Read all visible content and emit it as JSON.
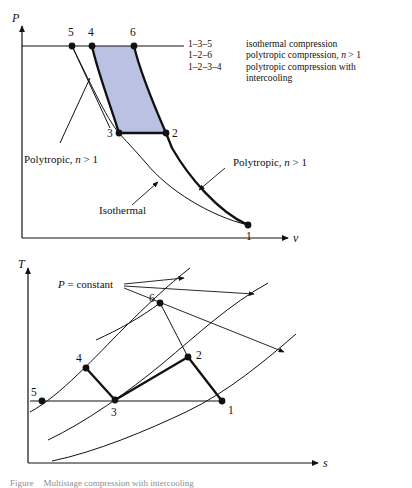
{
  "figure": {
    "title": "Multistage compression with intercooling",
    "caption_prefix": "Figure",
    "caption_text": "Multistage compression with intercooling"
  },
  "legend": {
    "rows": [
      {
        "key": "1–3–5",
        "desc": "isothermal compression",
        "desc_tail": "",
        "italic": ""
      },
      {
        "key": "1–2–6",
        "desc": "polytropic compression, ",
        "italic": "n",
        "desc_tail": " > 1"
      },
      {
        "key": "1–2–3–4",
        "desc": "polytropic compression with",
        "italic": "",
        "desc_tail": ""
      }
    ],
    "continuation": "intercooling"
  },
  "pv_chart": {
    "type": "line",
    "title": "P-v diagram",
    "xlabel": "v",
    "ylabel": "P",
    "axis": {
      "x0": 22,
      "y0": 238,
      "x1": 292,
      "y1": 22
    },
    "top_pressure_line": {
      "x_start": 22,
      "x_end": 184,
      "y": 46
    },
    "states": [
      {
        "id": "1",
        "label": "1",
        "x": 248,
        "y": 225,
        "label_x": 246,
        "label_y": 240
      },
      {
        "id": "2",
        "label": "2",
        "x": 166,
        "y": 133,
        "label_x": 172,
        "label_y": 136
      },
      {
        "id": "3",
        "label": "3",
        "x": 119,
        "y": 133,
        "label_x": 108,
        "label_y": 136
      },
      {
        "id": "4",
        "label": "4",
        "x": 92,
        "y": 46,
        "label_x": 89,
        "label_y": 36
      },
      {
        "id": "5",
        "label": "5",
        "x": 72,
        "y": 46,
        "label_x": 69,
        "label_y": 36
      },
      {
        "id": "6",
        "label": "6",
        "x": 134,
        "y": 46,
        "label_x": 131,
        "label_y": 36
      }
    ],
    "annotations": [
      {
        "name": "polytropic-left",
        "text": "Polytropic, ",
        "italic": "n",
        "tail": " > 1",
        "x": 24,
        "y": 160
      },
      {
        "name": "polytropic-right",
        "text": "Polytropic, ",
        "italic": "n",
        "tail": " > 1",
        "x": 228,
        "y": 163
      },
      {
        "name": "isothermal",
        "text": "Isothermal",
        "italic": "",
        "tail": "",
        "x": 99,
        "y": 211
      }
    ],
    "shaded_region_color": "#b9c2e2",
    "shaded_region_states": [
      "4",
      "6",
      "2",
      "3"
    ]
  },
  "ts_chart": {
    "type": "line",
    "title": "T-s diagram",
    "xlabel": "s",
    "ylabel": "T",
    "axis": {
      "x0": 28,
      "y0": 463,
      "x1": 330,
      "y1": 265
    },
    "pressure_label": "P = constant",
    "pressure_label_italic": "P",
    "pressure_label_rest": " = constant",
    "pressure_label_x": 58,
    "pressure_label_y": 282,
    "isotherm_line": {
      "x_start": 30,
      "x_end": 225,
      "y": 401
    },
    "states": [
      {
        "id": "1",
        "label": "1",
        "x": 222,
        "y": 401,
        "label_x": 228,
        "label_y": 412
      },
      {
        "id": "2",
        "label": "2",
        "x": 188,
        "y": 357,
        "label_x": 196,
        "label_y": 356
      },
      {
        "id": "3",
        "label": "3",
        "x": 115,
        "y": 400,
        "label_x": 111,
        "label_y": 414
      },
      {
        "id": "4",
        "label": "4",
        "x": 86,
        "y": 368,
        "label_x": 77,
        "label_y": 360
      },
      {
        "id": "5",
        "label": "5",
        "x": 42,
        "y": 401,
        "label_x": 33,
        "label_y": 396
      },
      {
        "id": "6",
        "label": "6",
        "x": 160,
        "y": 303,
        "label_x": 150,
        "label_y": 302
      }
    ],
    "constant_pressure_curve_count": 3
  },
  "colors": {
    "ink": "#111111",
    "shade": "#b9c2e2",
    "page": "#ffffff"
  }
}
